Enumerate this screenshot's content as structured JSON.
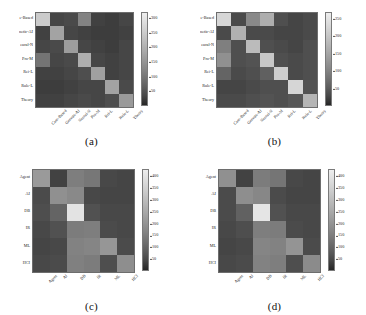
{
  "figure": {
    "background": "#ffffff",
    "colormap_low": "#2d2d2d",
    "colormap_high": "#f0f0f0",
    "panel_count": 4
  },
  "panels": [
    {
      "id": "a",
      "caption": "(a)",
      "row_labels": [
        "e-Based",
        "netic-AI",
        "eural-N",
        "Pro-M",
        "Rei-L",
        "Rule-L",
        "Theory"
      ],
      "col_labels": [
        "Case-Based",
        "Genetic-AI",
        "Neural-N",
        "Pro-M",
        "Rei-L",
        "Rule-L",
        "Theory"
      ],
      "colorbar": {
        "ticks": [
          "300",
          "250",
          "200",
          "150",
          "100",
          "50"
        ],
        "vmin": 0,
        "vmax": 320
      },
      "chart_data": {
        "type": "heatmap",
        "title": "(a)",
        "xlabel": "",
        "ylabel": "",
        "x_categories": [
          "Case-Based",
          "Genetic-AI",
          "Neural-N",
          "Pro-M",
          "Rei-L",
          "Rule-L",
          "Theory"
        ],
        "y_categories": [
          "e-Based",
          "netic-AI",
          "eural-N",
          "Pro-M",
          "Rei-L",
          "Rule-L",
          "Theory"
        ],
        "zlim": [
          0,
          320
        ],
        "grid": false,
        "legend": "colorbar-right",
        "values": [
          [
            250,
            30,
            35,
            120,
            25,
            20,
            30
          ],
          [
            25,
            175,
            30,
            25,
            20,
            20,
            25
          ],
          [
            30,
            35,
            165,
            30,
            25,
            20,
            30
          ],
          [
            95,
            30,
            35,
            195,
            30,
            25,
            30
          ],
          [
            25,
            25,
            30,
            40,
            170,
            25,
            30
          ],
          [
            20,
            20,
            25,
            30,
            30,
            175,
            35
          ],
          [
            25,
            25,
            30,
            35,
            30,
            40,
            160
          ]
        ]
      }
    },
    {
      "id": "b",
      "caption": "(b)",
      "row_labels": [
        "e-Based",
        "netic-AI",
        "eural-N",
        "Pro-M",
        "Rei-L",
        "Rule-L",
        "Theory"
      ],
      "col_labels": [
        "Case-Based",
        "Genetic-AI",
        "Neural-N",
        "Pro-M",
        "Rei-L",
        "Rule-L",
        "Theory"
      ],
      "colorbar": {
        "ticks": [
          "250",
          "200",
          "150",
          "100",
          "50"
        ],
        "vmin": 0,
        "vmax": 270
      },
      "chart_data": {
        "type": "heatmap",
        "title": "(b)",
        "xlabel": "",
        "ylabel": "",
        "x_categories": [
          "Case-Based",
          "Genetic-AI",
          "Neural-N",
          "Pro-M",
          "Rei-L",
          "Rule-L",
          "Theory"
        ],
        "y_categories": [
          "e-Based",
          "netic-AI",
          "eural-N",
          "Pro-M",
          "Rei-L",
          "Rule-L",
          "Theory"
        ],
        "zlim": [
          0,
          270
        ],
        "grid": false,
        "legend": "colorbar-right",
        "values": [
          [
            230,
            30,
            110,
            165,
            35,
            25,
            30
          ],
          [
            30,
            170,
            30,
            30,
            25,
            25,
            30
          ],
          [
            95,
            35,
            185,
            35,
            30,
            25,
            35
          ],
          [
            120,
            35,
            40,
            205,
            35,
            30,
            35
          ],
          [
            60,
            30,
            35,
            55,
            215,
            30,
            35
          ],
          [
            25,
            25,
            30,
            35,
            35,
            230,
            40
          ],
          [
            30,
            30,
            35,
            40,
            35,
            45,
            175
          ]
        ]
      }
    },
    {
      "id": "c",
      "caption": "(c)",
      "row_labels": [
        "Agent",
        "AI",
        "DB",
        "IR",
        "ML",
        "HCI"
      ],
      "col_labels": [
        "Agent",
        "AI",
        "DB",
        "IR",
        "ML",
        "HCI"
      ],
      "colorbar": {
        "ticks": [
          "400",
          "350",
          "300",
          "250",
          "200",
          "150",
          "100",
          "50"
        ],
        "vmin": 0,
        "vmax": 430
      },
      "chart_data": {
        "type": "heatmap",
        "title": "(c)",
        "xlabel": "",
        "ylabel": "",
        "x_categories": [
          "Agent",
          "AI",
          "DB",
          "IR",
          "ML",
          "HCI"
        ],
        "y_categories": [
          "Agent",
          "AI",
          "DB",
          "IR",
          "ML",
          "HCI"
        ],
        "zlim": [
          0,
          430
        ],
        "grid": false,
        "legend": "colorbar-right",
        "values": [
          [
            215,
            35,
            150,
            135,
            45,
            40
          ],
          [
            50,
            190,
            175,
            45,
            40,
            40
          ],
          [
            55,
            95,
            400,
            60,
            45,
            45
          ],
          [
            45,
            60,
            145,
            150,
            50,
            45
          ],
          [
            40,
            45,
            160,
            165,
            205,
            50
          ],
          [
            45,
            50,
            155,
            145,
            55,
            185
          ]
        ]
      }
    },
    {
      "id": "d",
      "caption": "(d)",
      "row_labels": [
        "Agent",
        "AI",
        "DB",
        "IR",
        "ML",
        "HCI"
      ],
      "col_labels": [
        "Agent",
        "AI",
        "DB",
        "IR",
        "ML",
        "HCI"
      ],
      "colorbar": {
        "ticks": [
          "400",
          "350",
          "300",
          "250",
          "200",
          "150",
          "100",
          "50"
        ],
        "vmin": 0,
        "vmax": 430
      },
      "chart_data": {
        "type": "heatmap",
        "title": "(d)",
        "xlabel": "",
        "ylabel": "",
        "x_categories": [
          "Agent",
          "AI",
          "DB",
          "IR",
          "ML",
          "HCI"
        ],
        "y_categories": [
          "Agent",
          "AI",
          "DB",
          "IR",
          "ML",
          "HCI"
        ],
        "zlim": [
          0,
          430
        ],
        "grid": false,
        "legend": "colorbar-right",
        "values": [
          [
            190,
            35,
            145,
            130,
            45,
            40
          ],
          [
            50,
            185,
            170,
            50,
            40,
            40
          ],
          [
            50,
            90,
            405,
            60,
            45,
            45
          ],
          [
            45,
            55,
            150,
            145,
            50,
            45
          ],
          [
            40,
            45,
            165,
            160,
            200,
            50
          ],
          [
            45,
            50,
            160,
            150,
            55,
            180
          ]
        ]
      }
    }
  ]
}
